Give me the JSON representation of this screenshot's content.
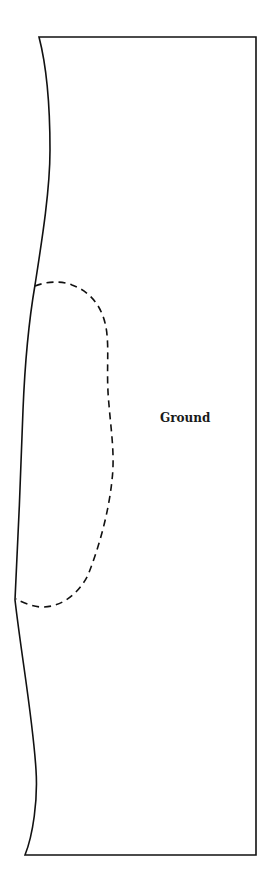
{
  "diagram": {
    "labels": {
      "ground": "Ground"
    },
    "colors": {
      "stroke": "#111111",
      "background": "#ffffff"
    },
    "regions": [
      {
        "name": "ground-area",
        "style": "solid outline"
      },
      {
        "name": "dashed-zone",
        "style": "dashed outline"
      }
    ]
  }
}
